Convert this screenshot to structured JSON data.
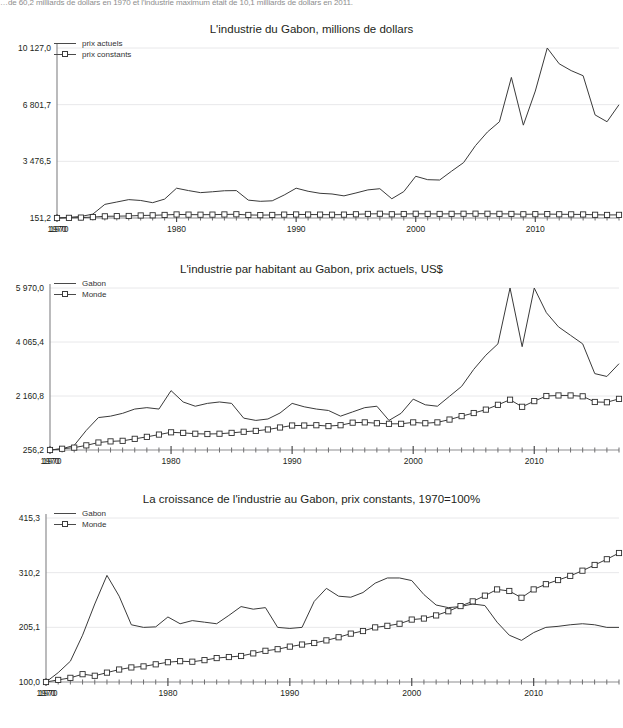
{
  "page": {
    "top_note": "…de 60,2 milliards de dollars en 1970 et l'industrie maximum  était de 10,1 milliards de dollars en 2011."
  },
  "charts": [
    {
      "id": "chart1",
      "title": "L'industrie du Gabon, millions de dollars",
      "legend": [
        {
          "label": "prix actuels",
          "marker": "none"
        },
        {
          "label": "prix constants",
          "marker": "square"
        }
      ],
      "ytick_labels": [
        "10 127,0",
        "6 801,7",
        "3 476,5",
        "151,2"
      ],
      "xtick_labels": [
        "1970",
        "1980",
        "1990",
        "2000",
        "2010"
      ]
    },
    {
      "id": "chart2",
      "title": "L'industrie par habitant au Gabon, prix actuels, US$",
      "legend": [
        {
          "label": "Gabon",
          "marker": "none"
        },
        {
          "label": "Monde",
          "marker": "square"
        }
      ],
      "ytick_labels": [
        "5 970,0",
        "4 065,4",
        "2 160,8",
        "256,2"
      ],
      "xtick_labels": [
        "1970",
        "1980",
        "1990",
        "2000",
        "2010"
      ]
    },
    {
      "id": "chart3",
      "title": "La croissance de l'industrie au Gabon, prix constants, 1970=100%",
      "legend": [
        {
          "label": "Gabon",
          "marker": "none"
        },
        {
          "label": "Monde",
          "marker": "square"
        }
      ],
      "ytick_labels": [
        "415,3",
        "310,2",
        "205,1",
        "100,0"
      ],
      "xtick_labels": [
        "1970",
        "1980",
        "1990",
        "2000",
        "2010"
      ]
    }
  ],
  "chart_data": [
    {
      "type": "line",
      "title": "L'industrie du Gabon, millions de dollars",
      "xlabel": "",
      "ylabel": "millions de dollars",
      "xlim": [
        1970,
        2017
      ],
      "ylim": [
        151.2,
        10127.0
      ],
      "yticks": [
        151.2,
        3476.5,
        6801.7,
        10127.0
      ],
      "xticks": [
        1970,
        1980,
        1990,
        2000,
        2010
      ],
      "grid": true,
      "legend_position": "top-left",
      "x": [
        1970,
        1971,
        1972,
        1973,
        1974,
        1975,
        1976,
        1977,
        1978,
        1979,
        1980,
        1981,
        1982,
        1983,
        1984,
        1985,
        1986,
        1987,
        1988,
        1989,
        1990,
        1991,
        1992,
        1993,
        1994,
        1995,
        1996,
        1997,
        1998,
        1999,
        2000,
        2001,
        2002,
        2003,
        2004,
        2005,
        2006,
        2007,
        2008,
        2009,
        2010,
        2011,
        2012,
        2013,
        2014,
        2015,
        2016,
        2017
      ],
      "series": [
        {
          "name": "prix actuels",
          "marker": "none",
          "values": [
            151.2,
            190,
            240,
            380,
            950,
            1090,
            1230,
            1180,
            1050,
            1260,
            1900,
            1760,
            1640,
            1690,
            1750,
            1760,
            1200,
            1130,
            1160,
            1500,
            1900,
            1720,
            1600,
            1560,
            1450,
            1620,
            1800,
            1870,
            1280,
            1700,
            2600,
            2400,
            2380,
            2900,
            3400,
            4400,
            5200,
            5800,
            8400,
            5600,
            7600,
            10127,
            9200,
            8800,
            8500,
            6200,
            5800,
            6800
          ]
        },
        {
          "name": "prix constants",
          "marker": "square",
          "values": [
            151.2,
            160,
            175,
            205,
            250,
            260,
            270,
            300,
            310,
            330,
            360,
            350,
            345,
            350,
            360,
            370,
            330,
            320,
            330,
            350,
            360,
            355,
            350,
            345,
            350,
            370,
            390,
            400,
            370,
            385,
            400,
            395,
            390,
            395,
            400,
            405,
            400,
            395,
            390,
            370,
            375,
            380,
            370,
            365,
            360,
            340,
            330,
            335
          ]
        }
      ]
    },
    {
      "type": "line",
      "title": "L'industrie par habitant au Gabon, prix actuels, US$",
      "xlabel": "",
      "ylabel": "US$ par habitant",
      "xlim": [
        1970,
        2017
      ],
      "ylim": [
        256.2,
        5970.0
      ],
      "yticks": [
        256.2,
        2160.8,
        4065.4,
        5970.0
      ],
      "xticks": [
        1970,
        1980,
        1990,
        2000,
        2010
      ],
      "grid": true,
      "legend_position": "top-left",
      "x": [
        1970,
        1971,
        1972,
        1973,
        1974,
        1975,
        1976,
        1977,
        1978,
        1979,
        1980,
        1981,
        1982,
        1983,
        1984,
        1985,
        1986,
        1987,
        1988,
        1989,
        1990,
        1991,
        1992,
        1993,
        1994,
        1995,
        1996,
        1997,
        1998,
        1999,
        2000,
        2001,
        2002,
        2003,
        2004,
        2005,
        2006,
        2007,
        2008,
        2009,
        2010,
        2011,
        2012,
        2013,
        2014,
        2015,
        2016,
        2017
      ],
      "series": [
        {
          "name": "Gabon",
          "marker": "none",
          "values": [
            256.2,
            300,
            420,
            950,
            1400,
            1450,
            1550,
            1700,
            1750,
            1700,
            2350,
            1950,
            1800,
            1900,
            1950,
            1900,
            1380,
            1300,
            1350,
            1560,
            1900,
            1780,
            1700,
            1650,
            1450,
            1600,
            1750,
            1800,
            1300,
            1550,
            2050,
            1850,
            1800,
            2150,
            2500,
            3100,
            3600,
            4000,
            5970,
            3900,
            5970,
            5100,
            4600,
            4300,
            4000,
            2950,
            2850,
            3300
          ]
        },
        {
          "name": "Monde",
          "marker": "square",
          "values": [
            256.2,
            300,
            340,
            420,
            520,
            560,
            580,
            650,
            720,
            800,
            880,
            860,
            830,
            820,
            830,
            860,
            900,
            930,
            980,
            1050,
            1120,
            1120,
            1130,
            1100,
            1130,
            1220,
            1230,
            1200,
            1180,
            1180,
            1230,
            1200,
            1230,
            1330,
            1450,
            1560,
            1680,
            1850,
            2030,
            1780,
            1980,
            2160,
            2180,
            2180,
            2150,
            1950,
            1940,
            2060
          ]
        }
      ]
    },
    {
      "type": "line",
      "title": "La croissance de l'industrie au Gabon, prix constants, 1970=100%",
      "xlabel": "",
      "ylabel": "1970=100%",
      "xlim": [
        1970,
        2017
      ],
      "ylim": [
        100.0,
        415.3
      ],
      "yticks": [
        100.0,
        205.1,
        310.2,
        415.3
      ],
      "xticks": [
        1970,
        1980,
        1990,
        2000,
        2010
      ],
      "grid": true,
      "legend_position": "top-left",
      "x": [
        1970,
        1971,
        1972,
        1973,
        1974,
        1975,
        1976,
        1977,
        1978,
        1979,
        1980,
        1981,
        1982,
        1983,
        1984,
        1985,
        1986,
        1987,
        1988,
        1989,
        1990,
        1991,
        1992,
        1993,
        1994,
        1995,
        1996,
        1997,
        1998,
        1999,
        2000,
        2001,
        2002,
        2003,
        2004,
        2005,
        2006,
        2007,
        2008,
        2009,
        2010,
        2011,
        2012,
        2013,
        2014,
        2015,
        2016,
        2017
      ],
      "series": [
        {
          "name": "Gabon",
          "marker": "none",
          "values": [
            100,
            118,
            140,
            190,
            250,
            305,
            265,
            210,
            205,
            206,
            225,
            212,
            218,
            215,
            212,
            228,
            245,
            240,
            243,
            205,
            203,
            205,
            255,
            280,
            265,
            263,
            272,
            290,
            300,
            300,
            295,
            268,
            248,
            243,
            245,
            250,
            247,
            215,
            190,
            180,
            195,
            205,
            207,
            210,
            212,
            210,
            205,
            205
          ]
        },
        {
          "name": "Monde",
          "marker": "square",
          "values": [
            100,
            104,
            108,
            115,
            112,
            118,
            124,
            128,
            130,
            134,
            138,
            140,
            139,
            142,
            146,
            148,
            150,
            155,
            160,
            163,
            168,
            172,
            175,
            180,
            186,
            193,
            198,
            205,
            208,
            212,
            220,
            222,
            228,
            236,
            246,
            255,
            266,
            278,
            275,
            262,
            278,
            288,
            296,
            304,
            314,
            325,
            336,
            348
          ]
        }
      ]
    }
  ]
}
